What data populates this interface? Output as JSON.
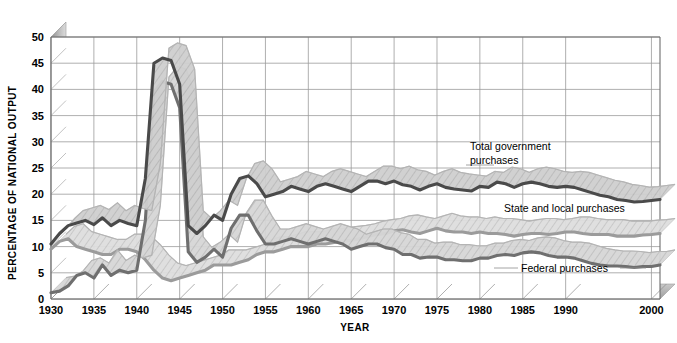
{
  "chart_data": {
    "type": "line",
    "title": "",
    "xlabel": "YEAR",
    "ylabel": "PERCENTAGE OF NATIONAL OUTPUT",
    "xlim": [
      1930,
      2001
    ],
    "ylim": [
      0,
      50
    ],
    "yticks": [
      0,
      5,
      10,
      15,
      20,
      25,
      30,
      35,
      40,
      45,
      50
    ],
    "xticks": [
      1930,
      1935,
      1940,
      1945,
      1950,
      1955,
      1960,
      1965,
      1970,
      1975,
      1980,
      1985,
      1990,
      2000
    ],
    "xtick_labels": [
      "1930",
      "1935",
      "1940",
      "1945",
      "1950",
      "1955",
      "1960",
      "1965",
      "1970",
      "1975",
      "1980",
      "1985",
      "1990",
      "2000"
    ],
    "grid": true,
    "legend_position": "inline-annotations",
    "style": "3d-ribbon",
    "x": [
      1930,
      1931,
      1932,
      1933,
      1934,
      1935,
      1936,
      1937,
      1938,
      1939,
      1940,
      1941,
      1942,
      1943,
      1944,
      1945,
      1946,
      1947,
      1948,
      1949,
      1950,
      1951,
      1952,
      1953,
      1954,
      1955,
      1956,
      1957,
      1958,
      1959,
      1960,
      1961,
      1962,
      1963,
      1964,
      1965,
      1966,
      1967,
      1968,
      1969,
      1970,
      1971,
      1972,
      1973,
      1974,
      1975,
      1976,
      1977,
      1978,
      1979,
      1980,
      1981,
      1982,
      1983,
      1984,
      1985,
      1986,
      1987,
      1988,
      1989,
      1990,
      1991,
      1992,
      1993,
      1994,
      1995,
      1996,
      1997,
      1998,
      1999,
      2000,
      2001
    ],
    "series": [
      {
        "name": "Total government purchases",
        "color": "#4a4a4a",
        "top_face_color": "#b9b9b9",
        "values": [
          10.5,
          12.5,
          14.0,
          14.5,
          15.0,
          14.2,
          15.5,
          14.0,
          15.0,
          14.4,
          14.0,
          23.0,
          45.0,
          46.0,
          45.5,
          41.0,
          14.0,
          12.5,
          14.0,
          16.0,
          15.0,
          20.0,
          23.0,
          23.5,
          22.0,
          19.5,
          20.0,
          20.5,
          21.5,
          21.0,
          20.5,
          21.5,
          22.0,
          21.5,
          21.0,
          20.5,
          21.5,
          22.5,
          22.5,
          22.0,
          22.5,
          21.8,
          21.5,
          20.8,
          21.5,
          22.0,
          21.3,
          21.0,
          20.8,
          20.6,
          21.5,
          21.3,
          22.3,
          22.0,
          21.3,
          22.0,
          22.3,
          22.0,
          21.5,
          21.3,
          21.5,
          21.3,
          20.8,
          20.3,
          19.8,
          19.5,
          19.0,
          18.8,
          18.5,
          18.6,
          18.8,
          19.0
        ]
      },
      {
        "name": "State and local purchases",
        "color": "#9b9b9b",
        "top_face_color": "#d2d2d2",
        "values": [
          9.5,
          11.0,
          11.5,
          10.0,
          9.5,
          9.0,
          8.5,
          8.5,
          9.5,
          9.5,
          9.0,
          7.5,
          5.5,
          4.0,
          3.5,
          4.0,
          4.5,
          5.0,
          5.5,
          6.5,
          6.5,
          6.5,
          7.0,
          7.5,
          8.5,
          9.0,
          9.0,
          9.5,
          10.0,
          10.0,
          10.0,
          10.5,
          10.5,
          10.8,
          11.0,
          11.2,
          11.5,
          12.0,
          12.3,
          12.5,
          13.0,
          13.2,
          12.8,
          12.5,
          13.0,
          13.5,
          13.0,
          12.8,
          12.8,
          12.5,
          12.8,
          12.5,
          12.5,
          12.3,
          12.0,
          12.3,
          12.5,
          12.5,
          12.3,
          12.5,
          12.8,
          12.8,
          12.5,
          12.3,
          12.3,
          12.3,
          12.0,
          12.0,
          12.0,
          12.2,
          12.3,
          12.5
        ]
      },
      {
        "name": "Federal purchases",
        "color": "#6f6f6f",
        "top_face_color": "#c4c4c4",
        "values": [
          1.2,
          1.5,
          2.5,
          4.5,
          5.0,
          4.0,
          6.5,
          4.5,
          5.5,
          5.0,
          5.5,
          15.0,
          39.5,
          41.5,
          41.0,
          36.5,
          9.0,
          7.0,
          8.0,
          9.5,
          8.0,
          13.5,
          16.0,
          16.0,
          13.0,
          10.5,
          10.5,
          11.0,
          11.5,
          11.0,
          10.5,
          11.0,
          11.5,
          11.0,
          10.5,
          9.5,
          10.0,
          10.5,
          10.5,
          9.8,
          9.5,
          8.5,
          8.5,
          7.8,
          8.0,
          8.0,
          7.5,
          7.5,
          7.3,
          7.3,
          7.8,
          7.8,
          8.3,
          8.5,
          8.3,
          8.8,
          9.0,
          8.8,
          8.3,
          8.0,
          8.0,
          7.8,
          7.3,
          6.8,
          6.5,
          6.3,
          6.3,
          6.2,
          6.0,
          6.2,
          6.2,
          6.5
        ]
      }
    ],
    "annotations": [
      {
        "name": "total-government-purchases-label",
        "text_line1": "Total government",
        "text_line2": "purchases"
      },
      {
        "name": "state-and-local-purchases-label",
        "text": "State and local purchases"
      },
      {
        "name": "federal-purchases-label",
        "text": "Federal purchases"
      }
    ]
  },
  "axis": {
    "y_title": "PERCENTAGE OF NATIONAL OUTPUT",
    "x_title": "YEAR"
  },
  "colors": {
    "total_line": "#4a4a4a",
    "state_local_line": "#9b9b9b",
    "federal_line": "#6f6f6f",
    "grid": "#9a9a9a",
    "frame": "#6d6d6d",
    "wall": "#b6b6b6",
    "floor": "#b0b0b0",
    "background": "#ffffff"
  },
  "labels": {
    "total": {
      "line1": "Total government",
      "line2": "purchases"
    },
    "state_local": "State and local purchases",
    "federal": "Federal purchases"
  }
}
